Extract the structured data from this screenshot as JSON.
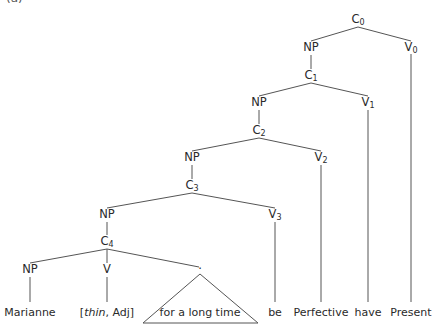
{
  "figure_label": "(a)",
  "tree": {
    "nodes": {
      "c0": {
        "base": "C",
        "sub": "0"
      },
      "np0": {
        "base": "NP"
      },
      "v0": {
        "base": "V",
        "sub": "0"
      },
      "c1": {
        "base": "C",
        "sub": "1"
      },
      "np1": {
        "base": "NP"
      },
      "v1": {
        "base": "V",
        "sub": "1"
      },
      "c2": {
        "base": "C",
        "sub": "2"
      },
      "np2": {
        "base": "NP"
      },
      "v2": {
        "base": "V",
        "sub": "2"
      },
      "c3": {
        "base": "C",
        "sub": "3"
      },
      "np3": {
        "base": "NP"
      },
      "v3": {
        "base": "V",
        "sub": "3"
      },
      "c4": {
        "base": "C",
        "sub": "4"
      },
      "np4": {
        "base": "NP"
      },
      "v4": {
        "base": "V"
      },
      "dot": {
        "base": "."
      }
    },
    "leaves": {
      "marianne": "Marianne",
      "thin_open": "[",
      "thin_word": "thin",
      "thin_rest": ", Adj]",
      "for_a_long_time": "for a long time",
      "be": "be",
      "perfective": "Perfective",
      "have": "have",
      "present": "Present"
    }
  },
  "colors": {
    "line": "#555555",
    "text": "#2a2a2a"
  }
}
